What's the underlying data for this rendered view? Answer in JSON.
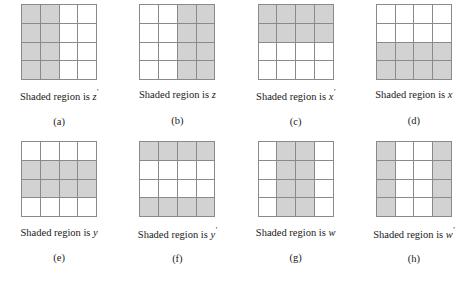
{
  "figure": {
    "shade_color": "#d2d2d2",
    "line_color": "#8a8a8a",
    "background": "#ffffff",
    "grid_rows": 4,
    "grid_cols": 4,
    "caption_prefix": "Shaded region is",
    "panels": [
      {
        "key": "a",
        "sublabel": "(a)",
        "caption_prefix": "Shaded region is",
        "variable": "z",
        "prime": "′",
        "caption_full": "Shaded region is z′",
        "shaded_description": "left two columns",
        "shaded": [
          [
            1,
            1,
            0,
            0
          ],
          [
            1,
            1,
            0,
            0
          ],
          [
            1,
            1,
            0,
            0
          ],
          [
            1,
            1,
            0,
            0
          ]
        ]
      },
      {
        "key": "b",
        "sublabel": "(b)",
        "caption_prefix": "Shaded region is",
        "variable": "z",
        "prime": "",
        "caption_full": "Shaded region is z",
        "shaded_description": "right two columns",
        "shaded": [
          [
            0,
            0,
            1,
            1
          ],
          [
            0,
            0,
            1,
            1
          ],
          [
            0,
            0,
            1,
            1
          ],
          [
            0,
            0,
            1,
            1
          ]
        ]
      },
      {
        "key": "c",
        "sublabel": "(c)",
        "caption_prefix": "Shaded region is",
        "variable": "x",
        "prime": "′",
        "caption_full": "Shaded region is x′",
        "shaded_description": "top two rows",
        "shaded": [
          [
            1,
            1,
            1,
            1
          ],
          [
            1,
            1,
            1,
            1
          ],
          [
            0,
            0,
            0,
            0
          ],
          [
            0,
            0,
            0,
            0
          ]
        ]
      },
      {
        "key": "d",
        "sublabel": "(d)",
        "caption_prefix": "Shaded region is",
        "variable": "x",
        "prime": "",
        "caption_full": "Shaded region is x",
        "shaded_description": "bottom two rows",
        "shaded": [
          [
            0,
            0,
            0,
            0
          ],
          [
            0,
            0,
            0,
            0
          ],
          [
            1,
            1,
            1,
            1
          ],
          [
            1,
            1,
            1,
            1
          ]
        ]
      },
      {
        "key": "e",
        "sublabel": "(e)",
        "caption_prefix": "Shaded region is",
        "variable": "y",
        "prime": "",
        "caption_full": "Shaded region is y",
        "shaded_description": "middle two rows",
        "shaded": [
          [
            0,
            0,
            0,
            0
          ],
          [
            1,
            1,
            1,
            1
          ],
          [
            1,
            1,
            1,
            1
          ],
          [
            0,
            0,
            0,
            0
          ]
        ]
      },
      {
        "key": "f",
        "sublabel": "(f)",
        "caption_prefix": "Shaded region is",
        "variable": "y",
        "prime": "′",
        "caption_full": "Shaded region is y′",
        "shaded_description": "top row and bottom row",
        "shaded": [
          [
            1,
            1,
            1,
            1
          ],
          [
            0,
            0,
            0,
            0
          ],
          [
            0,
            0,
            0,
            0
          ],
          [
            1,
            1,
            1,
            1
          ]
        ]
      },
      {
        "key": "g",
        "sublabel": "(g)",
        "caption_prefix": "Shaded region is",
        "variable": "w",
        "prime": "",
        "caption_full": "Shaded region is w",
        "shaded_description": "middle two columns",
        "shaded": [
          [
            0,
            1,
            1,
            0
          ],
          [
            0,
            1,
            1,
            0
          ],
          [
            0,
            1,
            1,
            0
          ],
          [
            0,
            1,
            1,
            0
          ]
        ]
      },
      {
        "key": "h",
        "sublabel": "(h)",
        "caption_prefix": "Shaded region is",
        "variable": "w",
        "prime": "′",
        "caption_full": "Shaded region is w′",
        "shaded_description": "outer two columns",
        "shaded": [
          [
            1,
            0,
            0,
            1
          ],
          [
            1,
            0,
            0,
            1
          ],
          [
            1,
            0,
            0,
            1
          ],
          [
            1,
            0,
            0,
            1
          ]
        ]
      }
    ]
  }
}
